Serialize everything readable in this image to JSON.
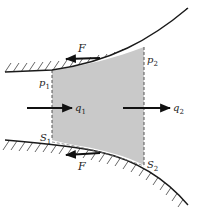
{
  "diagram": {
    "type": "flow-control-volume",
    "colors": {
      "wall": "#1a1a1a",
      "hatch": "#555555",
      "region_fill": "#c9c9c9",
      "dashed": "#555555",
      "arrow": "#111111"
    },
    "labels": {
      "force_top": "F",
      "force_bottom": "F",
      "pressure_1": "p",
      "pressure_1_sub": "1",
      "pressure_2": "p",
      "pressure_2_sub": "2",
      "flow_1": "q",
      "flow_1_sub": "1",
      "flow_2": "q",
      "flow_2_sub": "2",
      "section_1": "S",
      "section_1_sub": "1",
      "section_2": "S",
      "section_2_sub": "2"
    }
  }
}
